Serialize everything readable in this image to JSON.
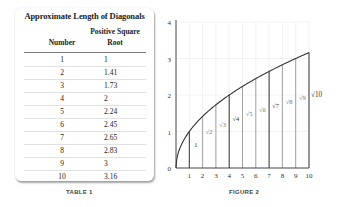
{
  "table": {
    "title": "Approximate Length of Diagonals",
    "columns": {
      "number_label": "Number",
      "root_label_line1": "Positive Square",
      "root_label_line2": "Root"
    },
    "rows": [
      {
        "number": "1",
        "root": "1"
      },
      {
        "number": "2",
        "root": "1.41"
      },
      {
        "number": "3",
        "root": "1.73"
      },
      {
        "number": "4",
        "root": "2"
      },
      {
        "number": "5",
        "root": "2.24"
      },
      {
        "number": "6",
        "root": "2.45"
      },
      {
        "number": "7",
        "root": "2.65"
      },
      {
        "number": "8",
        "root": "2.83"
      },
      {
        "number": "9",
        "root": "3"
      },
      {
        "number": "10",
        "root": "3.16"
      }
    ],
    "caption": "TABLE 1"
  },
  "figure": {
    "caption": "FIGURE 2",
    "x_ticks": [
      "1",
      "2",
      "3",
      "4",
      "5",
      "6",
      "7",
      "8",
      "9",
      "10"
    ],
    "y_ticks": [
      "0",
      "1",
      "2",
      "3",
      "4"
    ],
    "segment_labels": [
      "1",
      "√2",
      "√3",
      "√4",
      "√5",
      "√6",
      "√7",
      "√8",
      "√9",
      "√10"
    ]
  },
  "chart_data": {
    "type": "line",
    "title": "",
    "xlabel": "",
    "ylabel": "",
    "x": [
      0,
      1,
      2,
      3,
      4,
      5,
      6,
      7,
      8,
      9,
      10
    ],
    "series": [
      {
        "name": "y = √x",
        "values": [
          0,
          1,
          1.41,
          1.73,
          2,
          2.24,
          2.45,
          2.65,
          2.83,
          3,
          3.16
        ]
      }
    ],
    "vertical_segments": [
      1,
      2,
      3,
      4,
      5,
      6,
      7,
      8,
      9,
      10
    ],
    "annotations": [
      "1",
      "√2",
      "√3",
      "√4",
      "√5",
      "√6",
      "√7",
      "√8",
      "√9",
      "√10"
    ],
    "xlim": [
      0,
      10
    ],
    "ylim": [
      0,
      4
    ],
    "x_ticks": [
      1,
      2,
      3,
      4,
      5,
      6,
      7,
      8,
      9,
      10
    ],
    "y_ticks": [
      0,
      1,
      2,
      3,
      4
    ],
    "grid": true,
    "legend": "none"
  }
}
